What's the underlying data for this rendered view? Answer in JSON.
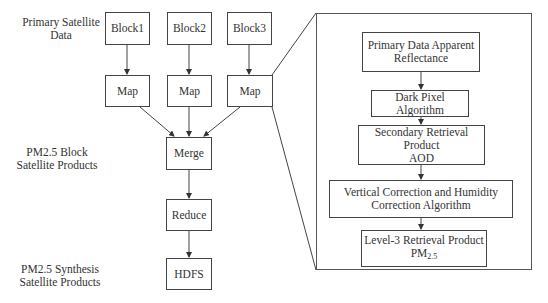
{
  "left_labels": {
    "primary": [
      "Primary Satellite",
      "Data"
    ],
    "block_products": [
      "PM2.5 Block",
      "Satellite Products"
    ],
    "synthesis_products": [
      "PM2.5 Synthesis",
      "Satellite Products"
    ]
  },
  "pipeline": {
    "blocks": [
      "Block1",
      "Block2",
      "Block3"
    ],
    "maps": [
      "Map",
      "Map",
      "Map"
    ],
    "merge": "Merge",
    "reduce": "Reduce",
    "hdfs": "HDFS"
  },
  "detail_panel": {
    "step1": [
      "Primary Data Apparent",
      "Reflectance"
    ],
    "step2": "Dark Pixel Algorithm",
    "step3": [
      "Secondary Retrieval Product",
      "AOD"
    ],
    "step4": [
      "Vertical Correction and Humidity",
      "Correction Algorithm"
    ],
    "step5_line1": "Level-3 Retrieval Product",
    "step5_pm": "PM",
    "step5_sub": "2.5"
  },
  "colors": {
    "line": "#444444",
    "background": "#ffffff"
  }
}
